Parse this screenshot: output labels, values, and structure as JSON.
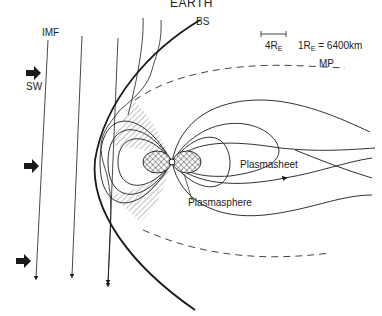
{
  "title": "EARTH",
  "labels": {
    "bow_shock": "BS",
    "imf": "IMF",
    "solar_wind": "SW",
    "magnetopause": "MP",
    "plasmasheet": "Plasmasheet",
    "plasmasphere": "Plasmasphere"
  },
  "scale": {
    "bar_value": "4R",
    "bar_sub": "E",
    "eq_prefix": "1R",
    "eq_sub": "E",
    "eq_value": " = 6400km"
  },
  "colors": {
    "line": "#1a1a1a",
    "dash": "#444444",
    "background": "#ffffff"
  }
}
